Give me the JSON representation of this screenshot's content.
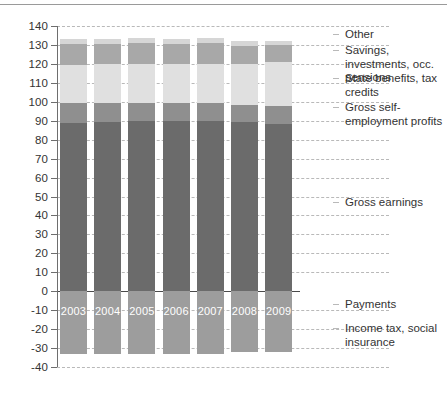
{
  "chart_data": {
    "type": "bar",
    "subtype": "stacked-bar-with-negative",
    "title": "",
    "xlabel": "",
    "ylabel": "Percentage of total net household income",
    "ylim": [
      -40,
      140
    ],
    "yticks": [
      140,
      130,
      120,
      110,
      100,
      90,
      80,
      70,
      60,
      50,
      40,
      30,
      20,
      10,
      0,
      -10,
      -20,
      -30,
      -40
    ],
    "ytick_labels": [
      "140",
      "130",
      "120",
      "110",
      "100",
      "90",
      "80",
      "70",
      "60",
      "50",
      "40",
      "30",
      "20",
      "10",
      "0",
      "-10",
      "-20",
      "-30",
      "-40"
    ],
    "grid": "horizontal-dashed",
    "legend_position": "right",
    "categories": [
      "2003",
      "2004",
      "2005",
      "2006",
      "2007",
      "2008",
      "2009"
    ],
    "series": [
      {
        "name": "Gross earnings",
        "color": "#6b6b6b",
        "values": [
          89.0,
          89.5,
          90.0,
          90.0,
          90.0,
          89.5,
          88.5
        ]
      },
      {
        "name": "Gross self-employment profits",
        "color": "#8f8f8f",
        "values": [
          10.5,
          10.0,
          9.5,
          9.5,
          9.5,
          9.0,
          9.5
        ]
      },
      {
        "name": "State benefits, tax credits",
        "color": "#e0e0e0",
        "values": [
          20.0,
          20.5,
          20.5,
          20.5,
          20.5,
          21.5,
          23.0
        ]
      },
      {
        "name": "Savings, investments, occ. pensions",
        "color": "#a8a8a8",
        "values": [
          11.0,
          10.5,
          11.0,
          10.5,
          11.0,
          9.5,
          9.0
        ]
      },
      {
        "name": "Other",
        "color": "#d6d6d6",
        "values": [
          2.5,
          2.5,
          2.5,
          2.5,
          2.5,
          2.5,
          2.0
        ]
      },
      {
        "name": "Income tax, social insurance",
        "color": "#9d9d9d",
        "values": [
          -33.0,
          -33.0,
          -33.0,
          -33.0,
          -33.0,
          -32.0,
          -32.0
        ]
      }
    ],
    "stack_tops": [
      133.0,
      133.0,
      133.5,
      133.0,
      133.5,
      132.0,
      132.0
    ]
  },
  "legend": {
    "items": [
      {
        "label": "Other",
        "color": "#d6d6d6"
      },
      {
        "label": "Savings, investments, occ. pensions",
        "color": "#a8a8a8"
      },
      {
        "label": "State benefits, tax credits",
        "color": "#e0e0e0"
      },
      {
        "label": "Gross self-employment profits",
        "color": "#8f8f8f"
      },
      {
        "label": "Gross earnings",
        "color": "#6b6b6b"
      },
      {
        "label": "Payments",
        "color": ""
      },
      {
        "label": "Income tax, social insurance",
        "color": "#9d9d9d"
      }
    ]
  },
  "axis": {
    "y_title": "Percentage of total net household income"
  },
  "colors": {
    "grid": "#b9b9b9",
    "axis": "#6e6e6e",
    "text": "#333333",
    "year_label": "#ffffff"
  }
}
